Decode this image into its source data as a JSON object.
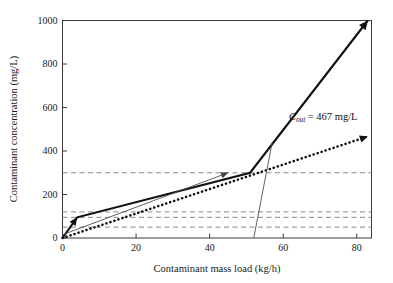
{
  "chart_data": {
    "type": "line",
    "title": "",
    "xlabel": "Contaminant mass load (kg/h)",
    "ylabel": "Contaminant concentration (mg/L)",
    "xlim": [
      0,
      84
    ],
    "ylim": [
      0,
      1000
    ],
    "xticks": [
      0,
      20,
      40,
      60,
      80
    ],
    "yticks": [
      0,
      200,
      400,
      600,
      800,
      1000
    ],
    "xtick_labels": [
      "0",
      "20",
      "40",
      "60",
      "80"
    ],
    "ytick_labels": [
      "0",
      "200",
      "400",
      "600",
      "800",
      "1000"
    ],
    "grid": false,
    "legend": "none",
    "reference_lines": [
      {
        "name": "limit-300",
        "axis": "y",
        "value": 300,
        "style": "dashed"
      },
      {
        "name": "limit-120",
        "axis": "y",
        "value": 120,
        "style": "dashed"
      },
      {
        "name": "limit-95",
        "axis": "y",
        "value": 95,
        "style": "dashed"
      },
      {
        "name": "limit-50",
        "axis": "y",
        "value": 50,
        "style": "dashed"
      }
    ],
    "series": [
      {
        "name": "composite-curve-thick",
        "style": "solid-thick",
        "arrow": "end",
        "points": [
          [
            0,
            0
          ],
          [
            4,
            95
          ],
          [
            51,
            300
          ],
          [
            83,
            1000
          ]
        ]
      },
      {
        "name": "water-supply-line-dotted",
        "style": "dotted-thick",
        "arrow": "end",
        "points": [
          [
            0,
            0
          ],
          [
            83,
            467
          ]
        ]
      },
      {
        "name": "pinch-line-thin",
        "style": "solid-thin",
        "arrow": "mid-right",
        "points": [
          [
            0,
            15
          ],
          [
            45,
            300
          ]
        ]
      },
      {
        "name": "drop-line-thin",
        "style": "solid-thin",
        "arrow": "none",
        "points": [
          [
            52,
            0
          ],
          [
            57,
            440
          ]
        ]
      }
    ],
    "annotations": [
      {
        "name": "cout-annotation",
        "symbol": "C",
        "subscript": "out",
        "text": " = 467 mg/L",
        "full_text": "C_out = 467 mg/L",
        "x": 58,
        "y": 560
      }
    ],
    "colors": {
      "axis": "#3a3a3a",
      "line_thick": "#111111",
      "line_dotted": "#111111",
      "line_thin": "#444444",
      "dashed_ref": "#8a8a8a",
      "text": "#1a1a1a",
      "background": "#ffffff"
    }
  }
}
